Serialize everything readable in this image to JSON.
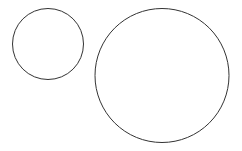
{
  "canvas": {
    "width": 242,
    "height": 151,
    "background": "#ffffff"
  },
  "shapes": [
    {
      "type": "circle",
      "name": "small-circle",
      "cx": 48,
      "cy": 44,
      "r": 35.5,
      "stroke": "#333333",
      "fill": "none",
      "stroke_width": 1
    },
    {
      "type": "circle",
      "name": "large-circle",
      "cx": 162,
      "cy": 75.5,
      "r": 67,
      "stroke": "#333333",
      "fill": "none",
      "stroke_width": 1
    }
  ]
}
